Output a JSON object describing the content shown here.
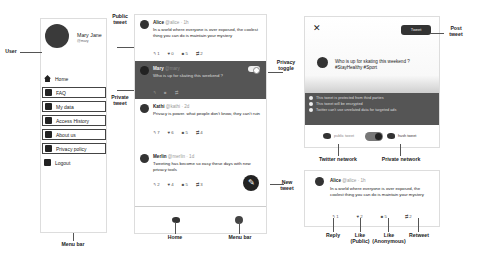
{
  "menu": {
    "user_name": "Mary Jane",
    "user_handle": "@mary",
    "items": [
      {
        "label": "Home",
        "icon": "home-icon",
        "boxed": false
      },
      {
        "label": "FAQ",
        "icon": "faq-icon",
        "boxed": true
      },
      {
        "label": "My data",
        "icon": "data-icon",
        "boxed": true
      },
      {
        "label": "Access History",
        "icon": "history-icon",
        "boxed": true
      },
      {
        "label": "About us",
        "icon": "people-icon",
        "boxed": true
      },
      {
        "label": "Privacy policy",
        "icon": "policy-icon",
        "boxed": true
      },
      {
        "label": "Logout",
        "icon": "logout-icon",
        "boxed": false
      }
    ]
  },
  "feed": {
    "tweets": [
      {
        "name": "Alice",
        "handle": "@alice",
        "time": "1h",
        "text": "In a world where everyone is over exposed, the coolest thing you can do is maintain your mystery",
        "reply": "1",
        "like": "0",
        "anon_like": "5",
        "retweet": "2",
        "private": false
      },
      {
        "name": "Mary",
        "handle": "@mary",
        "time": "now",
        "text": "Who is up for skating this weekend ?",
        "reply": "",
        "like": "",
        "anon_like": "",
        "retweet": "",
        "private": true
      },
      {
        "name": "Kathi",
        "handle": "@kathi",
        "time": "2d",
        "text": "Privacy is power. what people don't know, they can't ruin",
        "reply": "7",
        "like": "6",
        "anon_like": "5",
        "retweet": "4",
        "private": false
      },
      {
        "name": "Merlin",
        "handle": "@merlin",
        "time": "1d",
        "text": "Tweeting has become so easy these days with new privacy tools",
        "reply": "2",
        "like": "4",
        "anon_like": "5",
        "retweet": "3",
        "private": false
      }
    ],
    "fab_icon": "✎"
  },
  "composer": {
    "close": "✕",
    "post_label": "Tweet",
    "text_line1": "Who is up for skating this weekend ?",
    "text_line2": "#StayHealthy #Sport",
    "info": [
      "This tweet is protected from third parties",
      "This tweet will be encrypted",
      "Twitter can't use unrelated data for targeted ads"
    ],
    "public_label": "public tweet",
    "private_label": "hush tweet"
  },
  "single": {
    "name": "Alice",
    "handle": "@alice",
    "time": "1h",
    "text": "In a world where everyone is over exposed, the coolest thing you can do is maintain your mystery",
    "reply": "1",
    "like": "2",
    "anon_like": "5",
    "retweet": "2"
  },
  "callouts": {
    "user": "User",
    "menu_bar": "Menu bar",
    "public_tweet": "Public tweet",
    "private_tweet": "Private tweet",
    "privacy_toggle": "Privacy toggle",
    "new_tweet": "New tweet",
    "home": "Home",
    "menu_bar2": "Menu bar",
    "post_tweet": "Post tweet",
    "twitter_network": "Twitter network",
    "private_network": "Private network",
    "reply": "Reply",
    "like_public": "Like (Public)",
    "like_anon": "Like (Anonymous)",
    "retweet": "Retweet"
  }
}
